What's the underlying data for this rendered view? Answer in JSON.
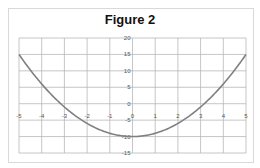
{
  "chart_data": {
    "type": "line",
    "title": "Figure 2",
    "xlabel": "",
    "ylabel": "",
    "function": "y = x^2 - 10",
    "x": [
      -5,
      -4.5,
      -4,
      -3.5,
      -3,
      -2.5,
      -2,
      -1.5,
      -1,
      -0.5,
      0,
      0.5,
      1,
      1.5,
      2,
      2.5,
      3,
      3.5,
      4,
      4.5,
      5
    ],
    "series": [
      {
        "name": "y",
        "color": "#808080",
        "values": [
          15,
          10.25,
          6,
          2.25,
          -1,
          -3.75,
          -6,
          -7.75,
          -9,
          -9.75,
          -10,
          -9.75,
          -9,
          -7.75,
          -6,
          -3.75,
          -1,
          2.25,
          6,
          10.25,
          15
        ]
      }
    ],
    "xlim": [
      -5,
      5
    ],
    "ylim": [
      -15,
      20
    ],
    "x_ticks": [
      -5,
      -4,
      -3,
      -2,
      -1,
      0,
      1,
      2,
      3,
      4,
      5
    ],
    "y_ticks": [
      20,
      15,
      10,
      5,
      0,
      -5,
      -10,
      -15
    ],
    "grid": true,
    "legend": "none"
  }
}
